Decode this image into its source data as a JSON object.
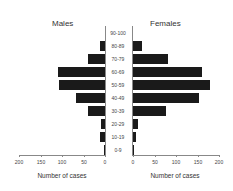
{
  "chart_data": {
    "type": "bar",
    "subtype": "population-pyramid",
    "title": "",
    "panels": [
      {
        "name": "Males",
        "side": "left"
      },
      {
        "name": "Females",
        "side": "right"
      }
    ],
    "categories": [
      "90-100",
      "80-89",
      "70-79",
      "60-69",
      "50-59",
      "40-49",
      "30-39",
      "20-29",
      "10-19",
      "0-9"
    ],
    "series": [
      {
        "name": "Males",
        "values": [
          0,
          12,
          40,
          110,
          106,
          68,
          40,
          9,
          11,
          2
        ]
      },
      {
        "name": "Females",
        "values": [
          0,
          21,
          82,
          160,
          179,
          154,
          76,
          12,
          8,
          2
        ]
      }
    ],
    "xlabel": "Number of cases",
    "ylabel": "",
    "xlim": [
      0,
      200
    ],
    "xticks": [
      0,
      50,
      100,
      150,
      200
    ],
    "grid": false,
    "legend": "none"
  },
  "labels": {
    "males": "Males",
    "females": "Females",
    "xlabel_left": "Number of cases",
    "xlabel_right": "Number of cases"
  }
}
